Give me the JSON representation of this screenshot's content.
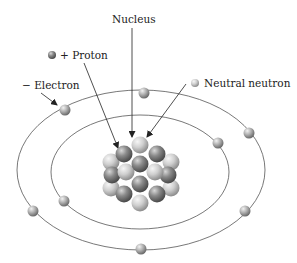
{
  "diagram": {
    "labels": {
      "nucleus": "Nucleus",
      "proton": "+ Proton",
      "electron": "− Electron",
      "neutron": "Neutral neutron"
    },
    "colors": {
      "background": "#ffffff",
      "orbit": "#555555",
      "proton_dark": "#6e6e6e",
      "neutron_light": "#c8c8c8",
      "electron": "#9a9a9a",
      "text": "#222222"
    },
    "orbits": [
      {
        "name": "outer-orbit",
        "cx": 141,
        "cy": 170,
        "rx": 124,
        "ry": 80
      },
      {
        "name": "inner-orbit",
        "cx": 140,
        "cy": 172,
        "rx": 89,
        "ry": 57
      }
    ],
    "electrons": [
      {
        "orbit": "outer",
        "x": 65,
        "y": 110
      },
      {
        "orbit": "outer",
        "x": 144,
        "y": 93
      },
      {
        "orbit": "outer",
        "x": 249,
        "y": 133
      },
      {
        "orbit": "outer",
        "x": 245,
        "y": 211
      },
      {
        "orbit": "outer",
        "x": 141,
        "y": 249
      },
      {
        "orbit": "outer",
        "x": 33,
        "y": 211
      },
      {
        "orbit": "inner",
        "x": 218,
        "y": 143
      },
      {
        "orbit": "inner",
        "x": 64,
        "y": 201
      }
    ],
    "nucleus_particles": 19
  }
}
